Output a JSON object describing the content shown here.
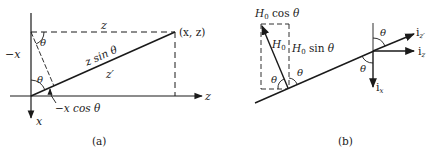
{
  "figure_a": {
    "caption": "(a)",
    "labels": {
      "z_top": "z",
      "point": "(x, z)",
      "neg_x": "−x",
      "theta_top": "θ",
      "theta_origin": "θ",
      "z_sin_theta": "z sin θ",
      "z_prime": "z′",
      "neg_x_cos_theta": "−x cos θ",
      "x_axis": "x",
      "z_axis": "z"
    }
  },
  "figure_b": {
    "caption": "(b)",
    "labels": {
      "h0_cos": "H₀ cos θ",
      "h0": "H₀",
      "h0_sin": "H₀ sin θ",
      "theta_left": "θ",
      "theta_right": "θ",
      "theta_axes_top": "θ",
      "theta_axes_left": "θ",
      "i_z_prime": "i",
      "i_z_prime_sub": "z′",
      "i_z": "i",
      "i_z_sub": "z",
      "i_x": "i",
      "i_x_sub": "x"
    }
  },
  "colors": {
    "ink": "#1a1a1a",
    "background": "#ffffff"
  }
}
